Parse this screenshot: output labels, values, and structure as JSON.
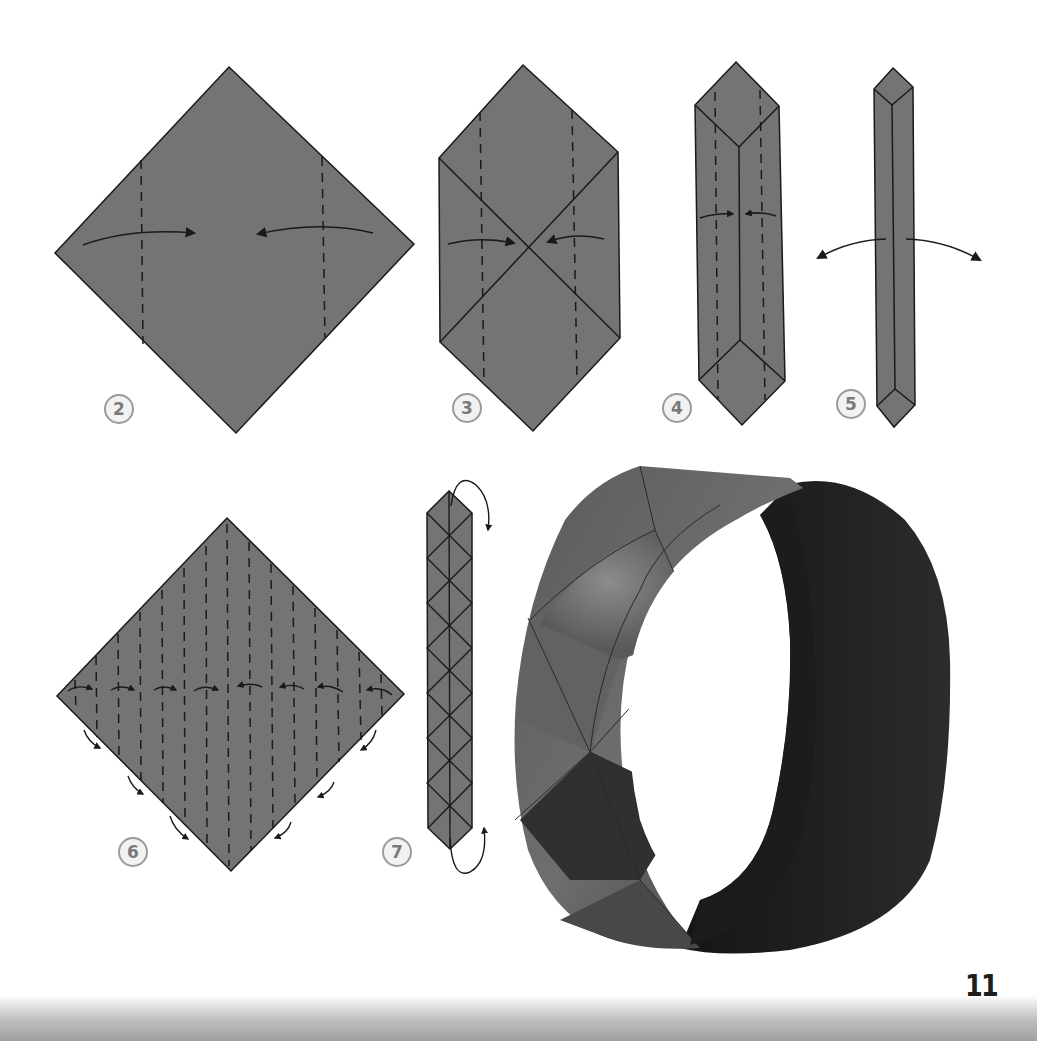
{
  "page": {
    "page_number": "11",
    "background": "#ffffff"
  },
  "colors": {
    "paper": "#747474",
    "line": "#1a1a1a",
    "step_circle_fill": "#f2f2f2",
    "step_circle_stroke": "#9a9a9a"
  },
  "steps": [
    {
      "number": "2",
      "description": "Square diamond with two vertical valley folds; edges fold toward center",
      "icon": "fold-in-arrows"
    },
    {
      "number": "3",
      "description": "Hexagon with diagonal creases; fold sides to center along dashed lines",
      "icon": "fold-in-arrows"
    },
    {
      "number": "4",
      "description": "Narrow hexagon strip; fold sides to center again",
      "icon": "fold-in-arrows"
    },
    {
      "number": "5",
      "description": "Thin strip; unfold back out",
      "icon": "unfold-arrows"
    },
    {
      "number": "6",
      "description": "Square with 15 vertical pleat creases; accordion-fold along creases",
      "icon": "pleat-arrows"
    },
    {
      "number": "7",
      "description": "Folded strip with diamond crease pattern; curve ends around to join",
      "icon": "wrap-arrows"
    }
  ],
  "photo": {
    "subject": "Finished origami bracelet",
    "alt": "Dark grey folded paper bracelet with diamond pattern"
  }
}
